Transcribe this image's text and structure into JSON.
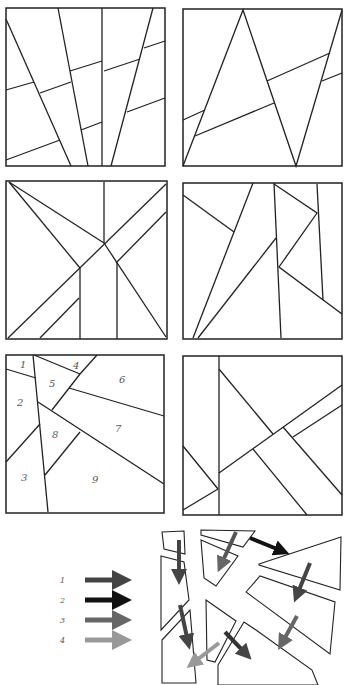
{
  "figure": {
    "panels": [
      {
        "id": "panel-a",
        "position": "row1-left"
      },
      {
        "id": "panel-b",
        "position": "row1-right"
      },
      {
        "id": "panel-c",
        "position": "row2-left"
      },
      {
        "id": "panel-d",
        "position": "row2-right"
      },
      {
        "id": "panel-e",
        "position": "row3-left",
        "labels": [
          "1",
          "2",
          "3",
          "4",
          "5",
          "6",
          "7",
          "8",
          "9"
        ]
      },
      {
        "id": "panel-f",
        "position": "row3-right"
      }
    ],
    "numbered_panel": {
      "labels": {
        "l1": "1",
        "l2": "2",
        "l3": "3",
        "l4": "4",
        "l5": "5",
        "l6": "6",
        "l7": "7",
        "l8": "8",
        "l9": "9"
      }
    },
    "legend": {
      "items": [
        {
          "label": "1",
          "color": "#444444"
        },
        {
          "label": "2",
          "color": "#111111"
        },
        {
          "label": "3",
          "color": "#666666"
        },
        {
          "label": "4",
          "color": "#999999"
        }
      ]
    },
    "exploded_view": {
      "description": "pieces of numbered panel separated with displacement arrows",
      "arrow_colors": {
        "dark": "#444444",
        "black": "#111111",
        "medium": "#666666",
        "light": "#999999"
      }
    }
  }
}
